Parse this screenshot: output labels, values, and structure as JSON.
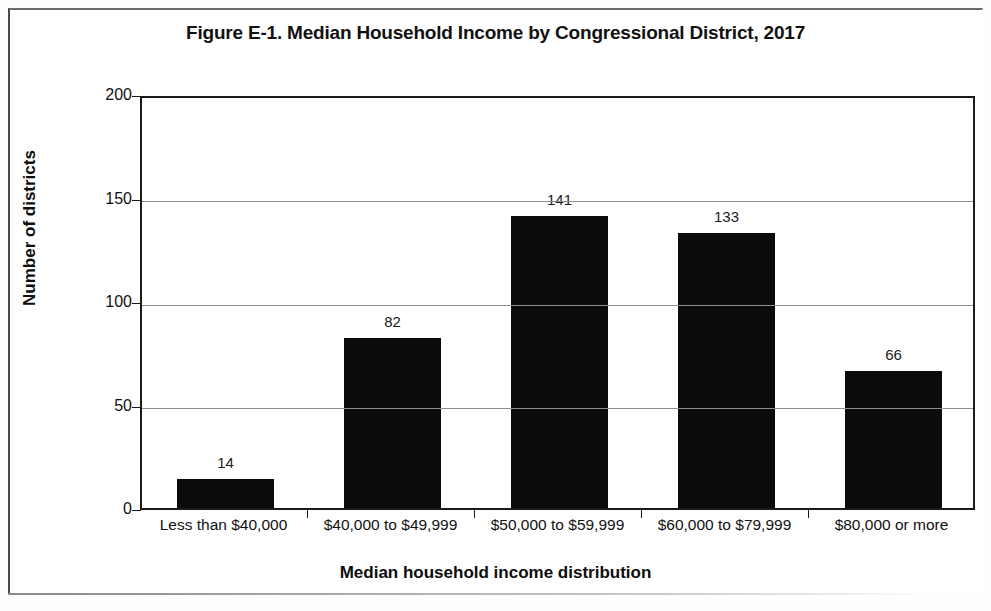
{
  "figure": {
    "title": "Figure E-1. Median Household Income by Congressional District, 2017"
  },
  "chart_data": {
    "type": "bar",
    "title": "Figure E-1. Median Household Income by Congressional District, 2017",
    "xlabel": "Median household income distribution",
    "ylabel": "Number of districts",
    "categories": [
      "Less than $40,000",
      "$40,000 to $49,999",
      "$50,000 to $59,999",
      "$60,000 to $79,999",
      "$80,000 or more"
    ],
    "values": [
      14,
      82,
      141,
      133,
      66
    ],
    "value_labels": [
      "14",
      "82",
      "141",
      "133",
      "66"
    ],
    "ylim": [
      0,
      200
    ],
    "ytick_labels": [
      "0",
      "50",
      "100",
      "150",
      "200"
    ],
    "ytick_values": [
      0,
      50,
      100,
      150,
      200
    ],
    "grid": true,
    "grid_axis": "y",
    "legend": false,
    "bar_color": "#0b0b0b",
    "plot_border_color": "#1a1a1a",
    "gridline_color": "#8d8d8d"
  }
}
